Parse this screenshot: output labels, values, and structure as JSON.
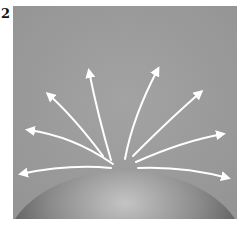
{
  "figure": {
    "label": "2",
    "background_color": "#9a9a9a",
    "arrow_color": "#ffffff",
    "sphere": {
      "shade_light": "#bdbdbd",
      "shade_dark": "#3a3a3a"
    },
    "arrow_count": 8
  }
}
